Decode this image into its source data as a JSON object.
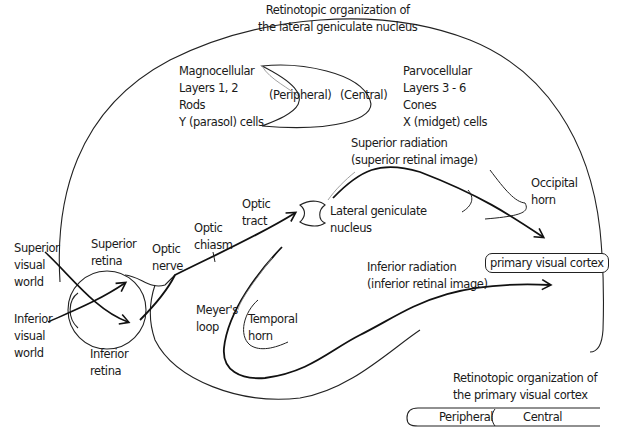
{
  "diagram": {
    "lgn_organization": {
      "title_line1": "Retinotopic organization of",
      "title_line2": "the lateral geniculate nucleus",
      "peripheral": "(Peripheral)",
      "central": "(Central)"
    },
    "magnocellular": {
      "line1": "Magnocellular",
      "line2": "Layers 1, 2",
      "line3": "Rods",
      "line4": "Y (parasol) cells"
    },
    "parvocellular": {
      "line1": "Parvocellular",
      "line2": "Layers 3 - 6",
      "line3": "Cones",
      "line4": "X (midget) cells"
    },
    "superior_radiation": {
      "line1": "Superior radiation",
      "line2": "(superior retinal image)"
    },
    "inferior_radiation": {
      "line1": "Inferior radiation",
      "line2": "(inferior retinal image)"
    },
    "occipital_horn": {
      "line1": "Occipital",
      "line2": "horn"
    },
    "lateral_geniculate": {
      "line1": "Lateral geniculate",
      "line2": "nucleus"
    },
    "optic_tract": {
      "line1": "Optic",
      "line2": "tract"
    },
    "optic_chiasm": {
      "line1": "Optic",
      "line2": "chiasm"
    },
    "optic_nerve": {
      "line1": "Optic",
      "line2": "nerve"
    },
    "superior_retina": {
      "line1": "Superior",
      "line2": "retina"
    },
    "inferior_retina": {
      "line1": "Inferior",
      "line2": "retina"
    },
    "superior_visual_world": {
      "line1": "Superior",
      "line2": "visual",
      "line3": "world"
    },
    "inferior_visual_world": {
      "line1": "Inferior",
      "line2": "visual",
      "line3": "world"
    },
    "meyers_loop": {
      "line1": "Meyer's",
      "line2": "loop"
    },
    "temporal_horn": {
      "line1": "Temporal",
      "line2": "horn"
    },
    "primary_visual_cortex": "primary visual cortex",
    "v1_organization": {
      "title_line1": "Retinotopic organization of",
      "title_line2": "the primary visual cortex",
      "peripheral": "Peripheral",
      "central": "Central"
    }
  }
}
